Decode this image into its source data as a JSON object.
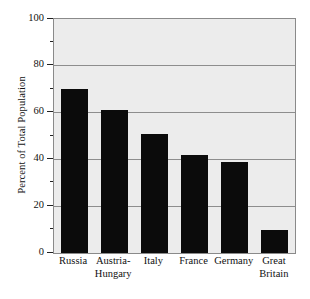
{
  "chart_data": {
    "type": "bar",
    "title": "",
    "subtitle": "",
    "xlabel": "",
    "ylabel": "Percent of Total Population",
    "categories": [
      "Russia",
      "Austria-Hungary",
      "Italy",
      "France",
      "Germany",
      "Great Britain"
    ],
    "category_lines": [
      [
        "Russia"
      ],
      [
        "Austria-",
        "Hungary"
      ],
      [
        "Italy"
      ],
      [
        "France"
      ],
      [
        "Germany"
      ],
      [
        "Great",
        "Britain"
      ]
    ],
    "values": [
      70,
      61,
      51,
      42,
      39,
      10
    ],
    "ylim": [
      0,
      100
    ],
    "ytick_major": [
      0,
      20,
      40,
      60,
      80,
      100
    ],
    "ytick_major_labels": [
      "0",
      "20",
      "40",
      "60",
      "80",
      "100"
    ],
    "ytick_minor": [
      10,
      30,
      50,
      70,
      90
    ],
    "grid": "horizontal-major",
    "legend": "none",
    "bar_color": "#0b0b0b",
    "plot_background": "#ececec",
    "figure_background": "#ffffff",
    "grid_color": "#8d8d8d",
    "axis_color": "#8a8a8a"
  }
}
